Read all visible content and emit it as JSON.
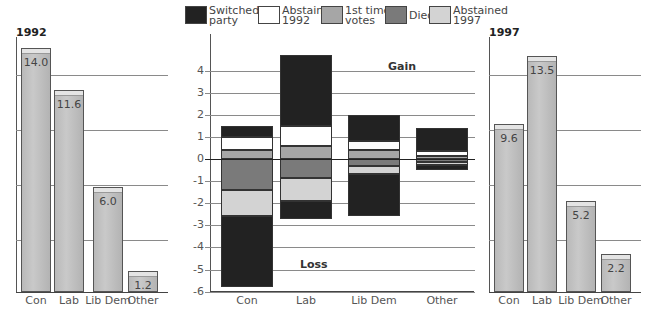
{
  "chart_data": [
    {
      "type": "bar",
      "title": "1992",
      "categories": [
        "Con",
        "Lab",
        "Lib Dem",
        "Other"
      ],
      "values": [
        14.0,
        11.6,
        6.0,
        1.2
      ],
      "value_labels": [
        "14.0",
        "11.6",
        "6.0",
        "1.2"
      ],
      "ylim": [
        0,
        14.5
      ],
      "grid": true
    },
    {
      "type": "bar",
      "stacked": true,
      "title": "",
      "categories": [
        "Con",
        "Lab",
        "Lib Dem",
        "Other"
      ],
      "y_ticks": [
        "4",
        "3",
        "2",
        "1",
        "0",
        "-1",
        "-2",
        "-3",
        "-4",
        "-5",
        "-6"
      ],
      "ylim": [
        -6,
        4.7
      ],
      "grid": true,
      "annotations": [
        "Gain",
        "Loss"
      ],
      "legend": [
        {
          "name": "Switched party",
          "line1": "Switched",
          "line2": "party",
          "color": "#222222"
        },
        {
          "name": "Abstained 1992",
          "line1": "Abstained",
          "line2": "1992",
          "color": "#ffffff"
        },
        {
          "name": "1st time votes",
          "line1": "1st time",
          "line2": "votes",
          "color": "#a6a6a6"
        },
        {
          "name": "Died",
          "line1": "Died",
          "line2": "",
          "color": "#7a7a7a"
        },
        {
          "name": "Abstained 1997",
          "line1": "Abstained",
          "line2": "1997",
          "color": "#d3d3d3"
        }
      ],
      "series": [
        {
          "name": "Switched party (gain)",
          "values": [
            0.5,
            3.2,
            1.2,
            1.05
          ]
        },
        {
          "name": "Abstained 1992",
          "values": [
            0.6,
            0.9,
            0.4,
            0.2
          ]
        },
        {
          "name": "1st time votes",
          "values": [
            0.4,
            0.6,
            0.4,
            0.15
          ]
        },
        {
          "name": "Died",
          "values": [
            -1.4,
            -0.85,
            -0.3,
            -0.15
          ]
        },
        {
          "name": "Abstained 1997",
          "values": [
            -1.2,
            -1.05,
            -0.4,
            -0.1
          ]
        },
        {
          "name": "Switched party (loss)",
          "values": [
            -3.2,
            -0.8,
            -1.9,
            -0.25
          ]
        }
      ],
      "segments": [
        [
          [
            1.5,
            1.0,
            "#222222"
          ],
          [
            1.0,
            0.4,
            "#ffffff"
          ],
          [
            0.4,
            0.0,
            "#a6a6a6"
          ],
          [
            0.0,
            -1.4,
            "#7a7a7a"
          ],
          [
            -1.4,
            -2.6,
            "#d3d3d3"
          ],
          [
            -2.6,
            -5.8,
            "#222222"
          ]
        ],
        [
          [
            4.7,
            1.5,
            "#222222"
          ],
          [
            1.5,
            0.6,
            "#ffffff"
          ],
          [
            0.6,
            0.0,
            "#a6a6a6"
          ],
          [
            0.0,
            -0.85,
            "#7a7a7a"
          ],
          [
            -0.85,
            -1.9,
            "#d3d3d3"
          ],
          [
            -1.9,
            -2.7,
            "#222222"
          ]
        ],
        [
          [
            2.0,
            0.8,
            "#222222"
          ],
          [
            0.8,
            0.4,
            "#ffffff"
          ],
          [
            0.4,
            0.0,
            "#a6a6a6"
          ],
          [
            0.0,
            -0.3,
            "#7a7a7a"
          ],
          [
            -0.3,
            -0.7,
            "#d3d3d3"
          ],
          [
            -0.7,
            -2.6,
            "#222222"
          ]
        ],
        [
          [
            1.4,
            0.35,
            "#222222"
          ],
          [
            0.35,
            0.15,
            "#ffffff"
          ],
          [
            0.15,
            0.0,
            "#a6a6a6"
          ],
          [
            0.0,
            -0.15,
            "#7a7a7a"
          ],
          [
            -0.15,
            -0.25,
            "#d3d3d3"
          ],
          [
            -0.25,
            -0.5,
            "#222222"
          ]
        ]
      ]
    },
    {
      "type": "bar",
      "title": "1997",
      "categories": [
        "Con",
        "Lab",
        "Lib Dem",
        "Other"
      ],
      "values": [
        9.6,
        13.5,
        5.2,
        2.2
      ],
      "value_labels": [
        "9.6",
        "13.5",
        "5.2",
        "2.2"
      ],
      "ylim": [
        0,
        14.5
      ],
      "grid": true
    }
  ],
  "left": {
    "year": "1992"
  },
  "right": {
    "year": "1997"
  },
  "middle": {
    "gain_label": "Gain",
    "loss_label": "Loss"
  }
}
